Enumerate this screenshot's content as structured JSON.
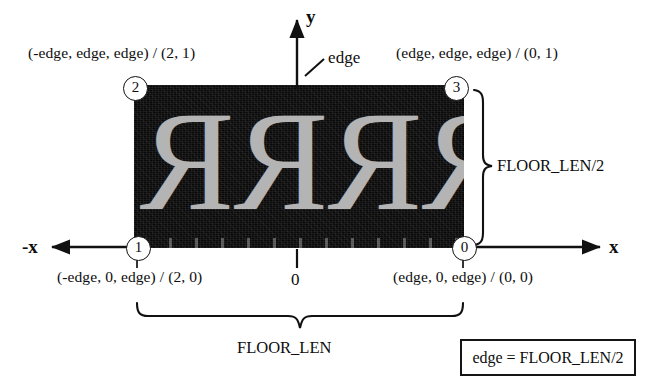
{
  "diagram": {
    "colors": {
      "ink": "#0d0d0d",
      "floor_background": "#090909",
      "glyph": "#b4b4b4",
      "paper": "#ffffff"
    }
  },
  "axes": {
    "y_label": "y",
    "x_label": "x",
    "neg_x_label": "-x",
    "origin_label": "0"
  },
  "annotations": {
    "edge_pointer": "edge",
    "vertical_brace": "FLOOR_LEN/2",
    "horizontal_brace": "FLOOR_LEN"
  },
  "legend": {
    "formula": "edge = FLOOR_LEN/2"
  },
  "vertices": [
    {
      "id": "0",
      "number": "0",
      "label": "(edge, 0, edge) / (0, 0)",
      "position": "bottom-right"
    },
    {
      "id": "1",
      "number": "1",
      "label": "(-edge, 0, edge) / (2, 0)",
      "position": "bottom-left"
    },
    {
      "id": "2",
      "number": "2",
      "label": "(-edge, edge, edge) / (2, 1)",
      "position": "top-left"
    },
    {
      "id": "3",
      "number": "3",
      "label": "(edge, edge, edge) / (0, 1)",
      "position": "top-right"
    }
  ],
  "floor_texture": {
    "glyphs": [
      "R",
      "R",
      "R",
      "R"
    ],
    "mirrored": "true",
    "description": "four mirrored capital R letters"
  }
}
